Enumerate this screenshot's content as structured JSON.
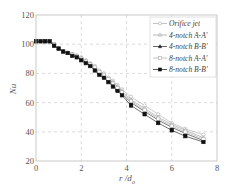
{
  "chart_data": {
    "type": "line",
    "title": "",
    "xlabel": "r /d_o",
    "xlabel_main": "r /d",
    "xlabel_sub": "o",
    "ylabel": "Nu",
    "xlim": [
      0,
      8
    ],
    "ylim": [
      20,
      120
    ],
    "xticks": [
      0,
      2,
      4,
      6,
      8
    ],
    "yticks": [
      20,
      40,
      60,
      80,
      100,
      120
    ],
    "grid": true,
    "legend_position": "upper right",
    "series": [
      {
        "name": "Orifice jet",
        "marker": "open-circle",
        "color": "#aaaaaa",
        "x": [
          0,
          0.2,
          0.4,
          0.6,
          0.8,
          1.0,
          1.2,
          1.4,
          1.6,
          1.8,
          2.0,
          2.2,
          2.4,
          2.6,
          2.8,
          3.0,
          3.2,
          3.4,
          3.6,
          3.8,
          4.2,
          4.8,
          5.4,
          6.0,
          6.6,
          7.4
        ],
        "y": [
          102,
          102,
          102,
          102,
          100,
          97,
          95,
          94,
          93,
          92,
          91,
          89,
          87,
          85,
          82,
          80,
          77,
          75,
          72,
          69,
          64,
          58,
          52,
          46,
          42,
          38
        ]
      },
      {
        "name": "4-notch A-A'",
        "marker": "open-triangle",
        "color": "#999999",
        "x": [
          0,
          0.2,
          0.4,
          0.6,
          0.8,
          1.0,
          1.2,
          1.4,
          1.6,
          1.8,
          2.0,
          2.2,
          2.4,
          2.6,
          2.8,
          3.0,
          3.2,
          3.4,
          3.6,
          3.8,
          4.2,
          4.8,
          5.4,
          6.0,
          6.6,
          7.4
        ],
        "y": [
          102,
          102,
          102,
          102,
          100,
          97,
          95,
          94,
          93,
          92,
          90,
          88,
          86,
          84,
          81,
          79,
          76,
          74,
          71,
          68,
          62,
          56,
          50,
          45,
          41,
          36
        ]
      },
      {
        "name": "4-notch B-B'",
        "marker": "filled-triangle",
        "color": "#222222",
        "x": [
          0,
          0.2,
          0.4,
          0.6,
          0.8,
          1.0,
          1.2,
          1.4,
          1.6,
          1.8,
          2.0,
          2.2,
          2.4,
          2.6,
          2.8,
          3.0,
          3.2,
          3.4,
          3.6,
          3.8,
          4.2,
          4.8,
          5.4,
          6.0,
          6.6,
          7.4
        ],
        "y": [
          102,
          102,
          102,
          102,
          99,
          97,
          95,
          94,
          93,
          92,
          90,
          88,
          86,
          83,
          80,
          78,
          75,
          72,
          69,
          66,
          60,
          54,
          48,
          43,
          39,
          34
        ]
      },
      {
        "name": "8-notch A-A'",
        "marker": "open-square",
        "color": "#aaaaaa",
        "x": [
          0,
          0.2,
          0.4,
          0.6,
          0.8,
          1.0,
          1.2,
          1.4,
          1.6,
          1.8,
          2.0,
          2.2,
          2.4,
          2.6,
          2.8,
          3.0,
          3.2,
          3.4,
          3.6,
          3.8,
          4.2,
          4.8,
          5.4,
          6.0,
          6.6,
          7.4
        ],
        "y": [
          102,
          102,
          102,
          102,
          100,
          97,
          95,
          94,
          93,
          92,
          90,
          88,
          86,
          84,
          81,
          79,
          76,
          73,
          70,
          67,
          61,
          55,
          49,
          44,
          40,
          35
        ]
      },
      {
        "name": "8-notch B-B'",
        "marker": "filled-square",
        "color": "#111111",
        "x": [
          0,
          0.2,
          0.4,
          0.6,
          0.8,
          1.0,
          1.2,
          1.4,
          1.6,
          1.8,
          2.0,
          2.2,
          2.4,
          2.6,
          2.8,
          3.0,
          3.2,
          3.4,
          3.6,
          3.8,
          4.2,
          4.8,
          5.4,
          6.0,
          6.6,
          7.4
        ],
        "y": [
          102,
          102,
          102,
          102,
          99,
          97,
          95,
          94,
          92,
          91,
          89,
          87,
          85,
          82,
          79,
          77,
          74,
          71,
          68,
          65,
          58,
          52,
          46,
          41,
          37,
          33
        ]
      }
    ]
  },
  "axes": {
    "ylabel": "Nu",
    "xlabel_main": "r /d",
    "xlabel_sub": "o",
    "xtick_labels": [
      "0",
      "2",
      "4",
      "6",
      "8"
    ],
    "ytick_labels": [
      "20",
      "40",
      "60",
      "80",
      "100",
      "120"
    ]
  },
  "legend": {
    "items": [
      "Orifice jet",
      "4-notch A-A'",
      "4-notch B-B'",
      "8-notch A-A'",
      "8-notch B-B'"
    ]
  }
}
